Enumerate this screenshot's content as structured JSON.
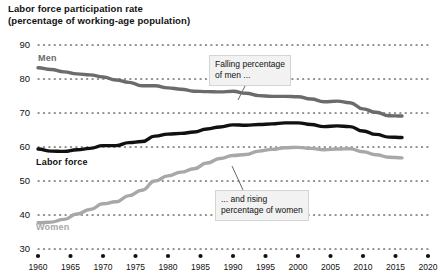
{
  "chart_data": {
    "type": "line",
    "title": "Labor force participation rate",
    "subtitle": "(percentage of working-age population)",
    "xlabel": "",
    "ylabel": "",
    "xlim": [
      1960,
      2020
    ],
    "ylim": [
      30,
      90
    ],
    "yticks": [
      30,
      40,
      50,
      60,
      70,
      80,
      90
    ],
    "xticks": [
      1960,
      1965,
      1970,
      1975,
      1980,
      1985,
      1990,
      1995,
      2000,
      2005,
      2010,
      2015,
      2020
    ],
    "grid": "horizontal-dotted",
    "legend": "inline-labels",
    "series": [
      {
        "name": "Men",
        "color": "#6b6b6b",
        "x": [
          1960,
          1962,
          1964,
          1966,
          1968,
          1970,
          1972,
          1974,
          1976,
          1978,
          1980,
          1982,
          1984,
          1986,
          1988,
          1990,
          1992,
          1994,
          1996,
          1998,
          2000,
          2002,
          2004,
          2006,
          2008,
          2010,
          2012,
          2014,
          2016
        ],
        "values": [
          83.3,
          82.8,
          82.1,
          81.5,
          81.2,
          80.6,
          79.7,
          79.0,
          78.0,
          78.0,
          77.4,
          77.0,
          76.4,
          76.3,
          76.2,
          76.4,
          75.8,
          75.1,
          74.9,
          74.9,
          74.8,
          74.1,
          73.3,
          73.5,
          73.0,
          71.2,
          70.2,
          69.2,
          69.1
        ]
      },
      {
        "name": "Labor force",
        "color": "#111111",
        "x": [
          1960,
          1962,
          1964,
          1966,
          1968,
          1970,
          1972,
          1974,
          1976,
          1978,
          1980,
          1982,
          1984,
          1986,
          1988,
          1990,
          1992,
          1994,
          1996,
          1998,
          2000,
          2002,
          2004,
          2006,
          2008,
          2010,
          2012,
          2014,
          2016
        ],
        "values": [
          59.4,
          58.8,
          58.7,
          59.2,
          59.6,
          60.4,
          60.4,
          61.3,
          61.6,
          63.2,
          63.8,
          64.0,
          64.4,
          65.3,
          65.9,
          66.5,
          66.4,
          66.6,
          66.8,
          67.1,
          67.1,
          66.6,
          66.0,
          66.2,
          66.0,
          64.7,
          63.7,
          62.9,
          62.8
        ]
      },
      {
        "name": "Women",
        "color": "#a8a8a8",
        "x": [
          1960,
          1962,
          1964,
          1966,
          1968,
          1970,
          1972,
          1974,
          1976,
          1978,
          1980,
          1982,
          1984,
          1986,
          1988,
          1990,
          1992,
          1994,
          1996,
          1998,
          2000,
          2002,
          2004,
          2006,
          2008,
          2010,
          2012,
          2014,
          2016
        ],
        "values": [
          37.7,
          37.9,
          38.7,
          40.3,
          41.6,
          43.3,
          43.9,
          45.7,
          47.3,
          50.0,
          51.5,
          52.6,
          53.6,
          55.3,
          56.6,
          57.5,
          57.8,
          58.8,
          59.3,
          59.8,
          59.9,
          59.6,
          59.2,
          59.4,
          59.5,
          58.6,
          57.7,
          57.0,
          56.8
        ]
      }
    ],
    "annotations": [
      {
        "id": "men-annotation",
        "line1": "Falling percentage",
        "line2": "of men ...",
        "points_to": "Men"
      },
      {
        "id": "women-annotation",
        "line1": "... and rising",
        "line2": "percentage of women",
        "points_to": "Women"
      }
    ]
  },
  "series_labels": {
    "men": "Men",
    "labor_force": "Labor force",
    "women": "Women"
  }
}
